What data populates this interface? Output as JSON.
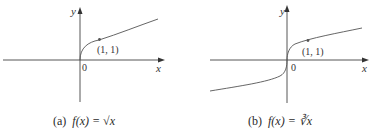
{
  "figure": {
    "colors": {
      "axis": "#444444",
      "curve": "#555555",
      "point": "#555555",
      "text": "#333333"
    },
    "panels": [
      {
        "id": "a",
        "x_axis_label": "x",
        "y_axis_label": "y",
        "origin_label": "0",
        "point_label": "(1, 1)",
        "caption_prefix": "(a)",
        "caption_func": "f(x) = ",
        "caption_radical": "√x",
        "function": "sqrt(x)"
      },
      {
        "id": "b",
        "x_axis_label": "x",
        "y_axis_label": "y",
        "origin_label": "0",
        "point_label": "(1, 1)",
        "caption_prefix": "(b)",
        "caption_func": "f(x) = ",
        "caption_radical": "∛x",
        "function": "cbrt(x)"
      }
    ]
  }
}
